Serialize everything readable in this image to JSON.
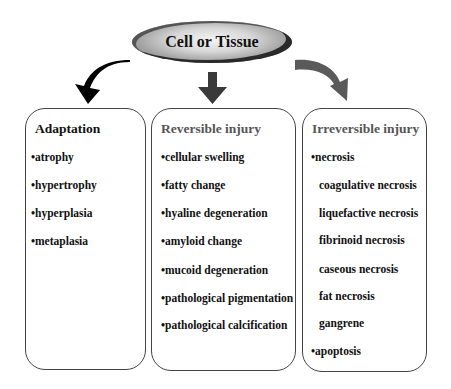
{
  "root": {
    "label": "Cell or Tissue"
  },
  "columns": [
    {
      "title": "Adaptation",
      "items": [
        "•atrophy",
        "•hypertrophy",
        "•hyperplasia",
        "•metaplasia"
      ]
    },
    {
      "title": "Reversible injury",
      "items": [
        "•cellular swelling",
        "•fatty change",
        "•hyaline degeneration",
        "•amyloid change",
        "•mucoid degeneration",
        "•pathological pigmentation",
        "•pathological calcification"
      ]
    },
    {
      "title": "Irreversible injury",
      "items": [
        "•necrosis",
        "coagulative necrosis",
        "liquefactive necrosis",
        "fibrinoid necrosis",
        "caseous necrosis",
        "fat necrosis",
        "gangrene",
        "•apoptosis"
      ]
    }
  ],
  "colors": {
    "left_arrow": "#000000",
    "mid_arrow": "#3a3a3a",
    "right_arrow": "#5a5a5a",
    "box_border": "#444444"
  }
}
